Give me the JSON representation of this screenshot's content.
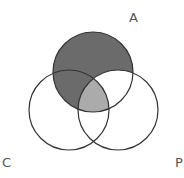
{
  "diagram": {
    "type": "venn-3",
    "labels": {
      "a": "A",
      "c": "C",
      "p": "P"
    },
    "colors": {
      "shaded_dark": "#6b6b6b",
      "shaded_light": "#ababab",
      "stroke": "#333333",
      "label": "#555555"
    },
    "shading": {
      "dark_region": "A minus P",
      "light_region": "A ∩ C ∩ P",
      "unshaded": "A ∩ P only, C only, P only, C ∩ P only"
    }
  }
}
